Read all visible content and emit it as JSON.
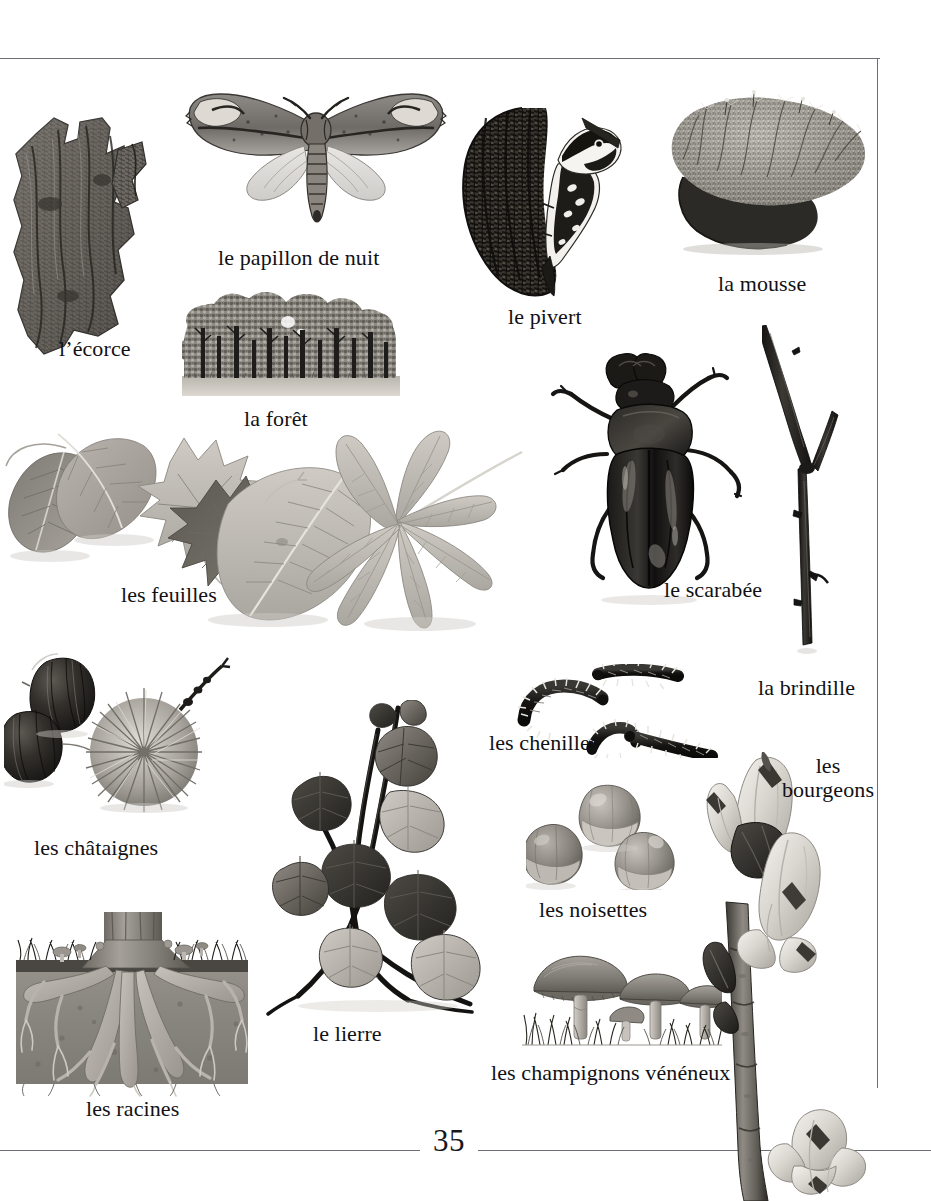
{
  "page": {
    "number": "35",
    "language": "French",
    "topic": "forest nature vocabulary",
    "background_color": "#ffffff",
    "frame_color": "#6d6f74",
    "text_color": "#111115"
  },
  "figures": [
    {
      "key": "bark",
      "icon": "tree-bark-photo",
      "label": "l’écorce"
    },
    {
      "key": "moth",
      "icon": "moth-photo",
      "label": "le papillon de nuit"
    },
    {
      "key": "forest",
      "icon": "forest-illustration",
      "label": "la forêt"
    },
    {
      "key": "woodpecker",
      "icon": "woodpecker-photo",
      "label": "le pivert"
    },
    {
      "key": "moss",
      "icon": "moss-photo",
      "label": "la mousse"
    },
    {
      "key": "leaves",
      "icon": "leaves-photo",
      "label": "les feuilles"
    },
    {
      "key": "beetle",
      "icon": "stag-beetle-photo",
      "label": "le scarabée"
    },
    {
      "key": "twig",
      "icon": "twig-photo",
      "label": "la brindille"
    },
    {
      "key": "chestnuts",
      "icon": "chestnuts-photo",
      "label": "les châtaignes"
    },
    {
      "key": "caterpillars",
      "icon": "caterpillars-photo",
      "label": "les chenilles"
    },
    {
      "key": "buds",
      "icon": "buds-photo",
      "label": "les bourgeons"
    },
    {
      "key": "ivy",
      "icon": "ivy-photo",
      "label": "le lierre"
    },
    {
      "key": "hazelnuts",
      "icon": "hazelnuts-photo",
      "label": "les noisettes"
    },
    {
      "key": "mushrooms",
      "icon": "poisonous-mushrooms-illustration",
      "label": "les champignons vénéneux"
    },
    {
      "key": "roots",
      "icon": "tree-roots-illustration",
      "label": "les racines"
    }
  ],
  "labels": {
    "bark": "l’écorce",
    "moth": "le papillon de nuit",
    "forest": "la forêt",
    "woodpecker": "le pivert",
    "moss": "la mousse",
    "leaves": "les feuilles",
    "beetle": "le scarabée",
    "twig": "la brindille",
    "chestnuts": "les châtaignes",
    "caterpillars": "les chenilles",
    "buds_line1": "les",
    "buds_line2": "bourgeons",
    "ivy": "le lierre",
    "hazelnuts": "les noisettes",
    "mushrooms": "les champignons vénéneux",
    "roots": "les racines"
  }
}
